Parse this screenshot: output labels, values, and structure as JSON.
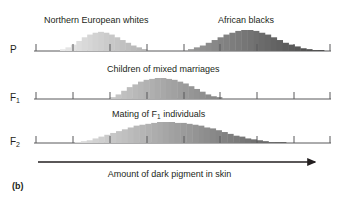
{
  "figure": {
    "panel_letter": "(b)",
    "axis_caption": "Amount of dark pigment in skin",
    "rows": [
      {
        "label": "P",
        "label_sub": "",
        "titles": [
          {
            "text": "Northern European whites",
            "x": 44
          },
          {
            "text": "African blacks",
            "x": 218
          }
        ]
      },
      {
        "label": "F",
        "label_sub": "1",
        "titles": [
          {
            "text": "Children of mixed marriages",
            "x": 107
          }
        ]
      },
      {
        "label": "F",
        "label_sub": "2",
        "titles": [
          {
            "text": "Mating of F",
            "sub": "1",
            "text2": " individuals",
            "x": 112
          }
        ]
      }
    ]
  },
  "chart_data": {
    "type": "bar",
    "xlabel": "Amount of dark pigment in skin",
    "ylabel": "Frequency",
    "grid": false,
    "legend": "none",
    "axis": {
      "x_start_px": 34,
      "x_end_px": 331,
      "tick_count": 9,
      "tick_positions_px": [
        36,
        73,
        110,
        147,
        184,
        220,
        257,
        294,
        330
      ],
      "tick_labels": [
        "",
        "",
        "",
        "",
        "",
        "",
        "",
        "",
        ""
      ],
      "axis_note": "Unlabeled tick marks mark genotype classes along an increasing-pigment scale"
    },
    "shading_note": "Bars are shaded from very light (left, little pigment) to very dark (right, much pigment); fill darkness tracks horizontal position on the pigment axis.",
    "panels": [
      {
        "generation": "P",
        "axis_y_px": 51,
        "series": [
          {
            "name": "Northern European whites",
            "x_start_px": 60,
            "x_end_px": 147,
            "bar_width_px": 5.8,
            "values": [
              2,
              4,
              7,
              11,
              15,
              18,
              20,
              21,
              20,
              18,
              15,
              12,
              9,
              6,
              4,
              2
            ]
          },
          {
            "name": "African blacks",
            "x_start_px": 188,
            "x_end_px": 324,
            "bar_width_px": 5.8,
            "values": [
              2,
              4,
              6,
              9,
              12,
              15,
              18,
              20,
              22,
              23,
              23,
              22,
              20,
              18,
              15,
              12,
              9,
              7,
              5,
              3,
              2,
              1,
              1
            ]
          }
        ]
      },
      {
        "generation": "F1",
        "axis_y_px": 99,
        "series": [
          {
            "name": "Children of mixed marriages",
            "x_start_px": 110,
            "x_end_px": 222,
            "bar_width_px": 5.8,
            "values": [
              2,
              5,
              9,
              13,
              16,
              19,
              21,
              22,
              23,
              23,
              22,
              21,
              19,
              17,
              14,
              11,
              8,
              5,
              3,
              2
            ]
          }
        ]
      },
      {
        "generation": "F2",
        "axis_y_px": 143,
        "series": [
          {
            "name": "Mating of F1 individuals",
            "x_start_px": 75,
            "x_end_px": 286,
            "bar_width_px": 5.8,
            "values": [
              1,
              2,
              3,
              5,
              7,
              9,
              11,
              13,
              15,
              17,
              19,
              20,
              21,
              22,
              23,
              23,
              23,
              22,
              22,
              21,
              20,
              19,
              17,
              16,
              14,
              12,
              10,
              8,
              7,
              5,
              4,
              3,
              2,
              1,
              1,
              1
            ]
          }
        ]
      }
    ]
  }
}
